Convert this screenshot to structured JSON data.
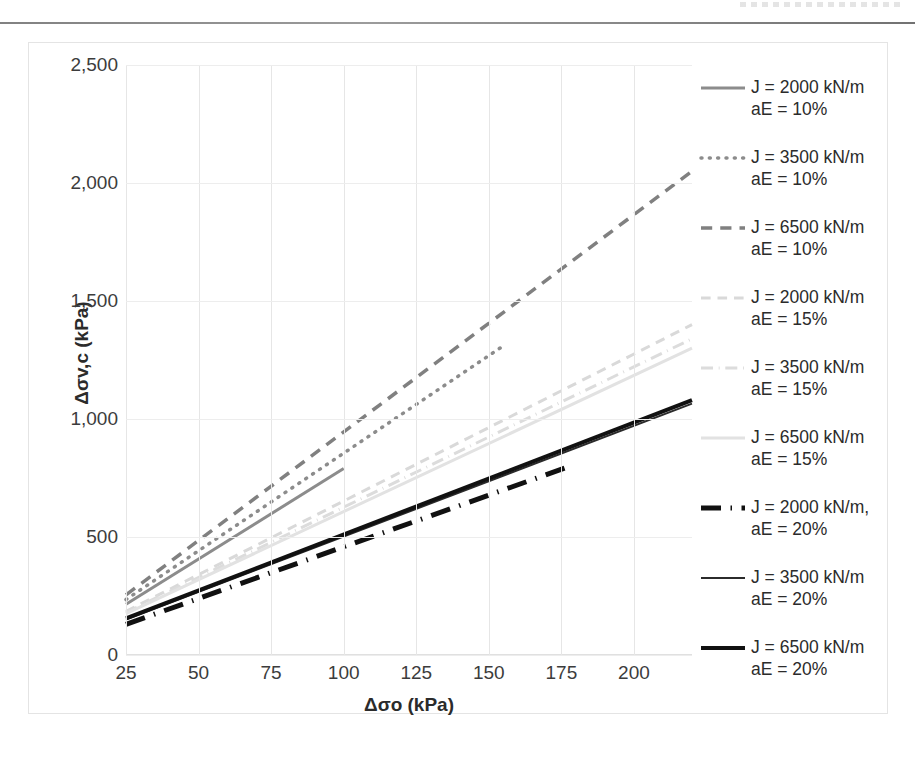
{
  "chart_data": {
    "type": "line",
    "title": "",
    "xlabel": "Δσo (kPa)",
    "ylabel": "Δσv,c (kPa)",
    "xlim": [
      25,
      220
    ],
    "ylim": [
      0,
      2500
    ],
    "x_ticks": [
      25,
      50,
      75,
      100,
      125,
      150,
      175,
      200
    ],
    "y_ticks": [
      0,
      500,
      1000,
      1500,
      2000,
      2500
    ],
    "x_tick_labels": [
      "25",
      "50",
      "75",
      "100",
      "125",
      "150",
      "175",
      "200"
    ],
    "y_tick_labels": [
      "0",
      "500",
      "1,000",
      "1,500",
      "2,000",
      "2,500"
    ],
    "grid": "both",
    "legend_position": "right",
    "series": [
      {
        "name": "J = 2000 kN/m\naE = 10%",
        "label_line1": "J = 2000 kN/m",
        "label_line2": "aE = 10%",
        "style": "solid",
        "color": "#8c8c8c",
        "width": 3,
        "x": [
          25,
          100
        ],
        "y": [
          215,
          790
        ]
      },
      {
        "name": "J = 3500 kN/m\naE = 10%",
        "label_line1": "J = 3500 kN/m",
        "label_line2": "aE = 10%",
        "style": "dotted",
        "color": "#8c8c8c",
        "width": 3.5,
        "x": [
          25,
          155
        ],
        "y": [
          235,
          1310
        ]
      },
      {
        "name": "J = 6500 kN/m\naE = 10%",
        "label_line1": "J = 6500 kN/m",
        "label_line2": "aE = 10%",
        "style": "dashed",
        "color": "#808080",
        "width": 3.5,
        "x": [
          25,
          220
        ],
        "y": [
          255,
          2050
        ]
      },
      {
        "name": "J = 2000 kN/m\naE = 15%",
        "label_line1": "J = 2000 kN/m",
        "label_line2": "aE = 15%",
        "style": "dashed",
        "color": "#d9d9d9",
        "width": 3,
        "x": [
          25,
          220
        ],
        "y": [
          185,
          1400
        ]
      },
      {
        "name": "J = 3500 kN/m\naE = 15%",
        "label_line1": "J = 3500 kN/m",
        "label_line2": "aE = 15%",
        "style": "dashdot",
        "color": "#dcdcdc",
        "width": 3,
        "x": [
          25,
          220
        ],
        "y": [
          180,
          1340
        ]
      },
      {
        "name": "J = 6500 kN/m\naE = 15%",
        "label_line1": "J = 6500 kN/m",
        "label_line2": "aE = 15%",
        "style": "solid",
        "color": "#e2e2e2",
        "width": 3,
        "x": [
          25,
          220
        ],
        "y": [
          175,
          1300
        ]
      },
      {
        "name": "J = 2000 kN/m, aE = 20%",
        "label_line1": "J = 2000 kN/m,",
        "label_line2": "aE = 20%",
        "style": "dashdot",
        "color": "#111111",
        "width": 5,
        "x": [
          25,
          178
        ],
        "y": [
          130,
          800
        ]
      },
      {
        "name": "J = 3500 kN/m\naE = 20%",
        "label_line1": "J = 3500 kN/m",
        "label_line2": "aE = 20%",
        "style": "solid",
        "color": "#2b2b2b",
        "width": 2,
        "x": [
          25,
          220
        ],
        "y": [
          150,
          1065
        ]
      },
      {
        "name": "J = 6500 kN/m\naE = 20%",
        "label_line1": "J = 6500 kN/m",
        "label_line2": "aE = 20%",
        "style": "solid",
        "color": "#111111",
        "width": 4,
        "x": [
          25,
          220
        ],
        "y": [
          155,
          1080
        ]
      }
    ]
  },
  "legend": {
    "items": [
      {
        "line1": "J = 2000 kN/m",
        "line2": "aE = 10%"
      },
      {
        "line1": "J = 3500 kN/m",
        "line2": "aE = 10%"
      },
      {
        "line1": "J = 6500 kN/m",
        "line2": "aE = 10%"
      },
      {
        "line1": "J = 2000 kN/m",
        "line2": "aE = 15%"
      },
      {
        "line1": "J = 3500 kN/m",
        "line2": "aE = 15%"
      },
      {
        "line1": "J = 6500 kN/m",
        "line2": "aE = 15%"
      },
      {
        "line1": "J = 2000 kN/m,",
        "line2": "aE = 20%"
      },
      {
        "line1": "J = 3500 kN/m",
        "line2": "aE = 20%"
      },
      {
        "line1": "J = 6500 kN/m",
        "line2": "aE = 20%"
      }
    ]
  },
  "axes": {
    "y_title": "Δσv,c (kPa)",
    "x_title": "Δσo (kPa)"
  }
}
